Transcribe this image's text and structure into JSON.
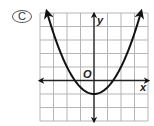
{
  "choice": {
    "label": "C"
  },
  "graph": {
    "x_axis_label": "x",
    "y_axis_label": "y",
    "origin_label": "O",
    "grid_cols": 8,
    "grid_rows": 8,
    "colors": {
      "grid": "#b5b5b5",
      "axis": "#222222",
      "curve": "#111111"
    }
  },
  "chart_data": {
    "type": "line",
    "title": "",
    "xlabel": "x",
    "ylabel": "y",
    "grid": true,
    "xlim": [
      -4,
      4
    ],
    "ylim": [
      -3,
      5
    ],
    "series": [
      {
        "name": "parabola",
        "equation": "y = 0.5x^2 - 1",
        "vertex": [
          0,
          -1
        ],
        "x_intercepts": [
          -1.41,
          1.41
        ],
        "x": [
          -3.4,
          -3,
          -2,
          -1,
          0,
          1,
          2,
          3,
          3.4
        ],
        "values": [
          4.78,
          3.5,
          1,
          -0.5,
          -1,
          -0.5,
          1,
          3.5,
          4.78
        ]
      }
    ]
  }
}
